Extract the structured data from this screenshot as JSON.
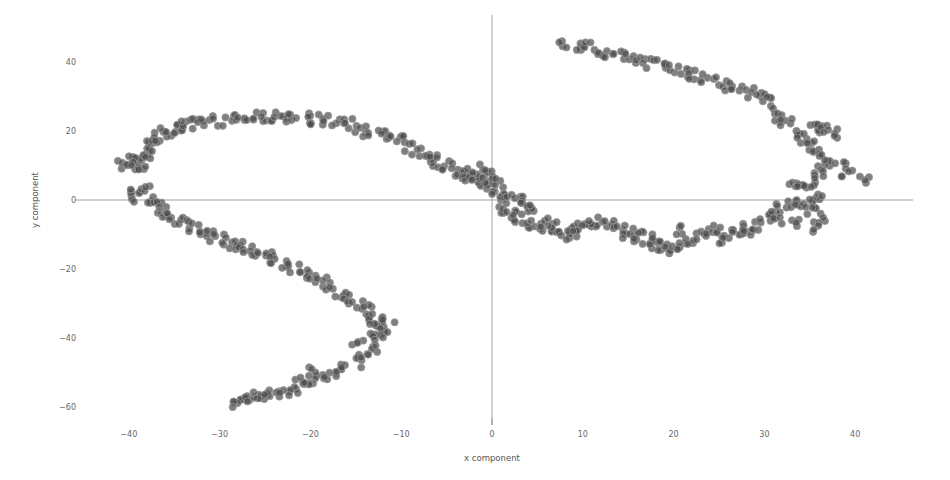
{
  "chart_data": {
    "type": "scatter",
    "title": "",
    "xlabel": "x component",
    "ylabel": "y component",
    "xlim": [
      -45,
      46
    ],
    "ylim": [
      -64,
      47
    ],
    "x_ticks": [
      -40,
      -30,
      -20,
      -10,
      0,
      10,
      20,
      30,
      40
    ],
    "y_ticks": [
      -60,
      -40,
      -20,
      0,
      20,
      40
    ],
    "x_tick_labels": [
      "−40",
      "−30",
      "−20",
      "−10",
      "0",
      "10",
      "20",
      "30",
      "40"
    ],
    "y_tick_labels": [
      "−60",
      "−40",
      "−20",
      "0",
      "20",
      "40"
    ],
    "grid": false,
    "zero_lines": true,
    "legend": null,
    "marker_color": "#4d4d4d",
    "series": [
      {
        "name": "points",
        "x": [
          -40.5,
          -39.8,
          -39.2,
          -38.5,
          -38.8,
          -39.6,
          -38.2,
          -37.6,
          -38.0,
          -37.2,
          -36.6,
          -36.0,
          -35.2,
          -34.4,
          -33.5,
          -32.5,
          -31.4,
          -30.2,
          -29.0,
          -27.8,
          -26.6,
          -25.4,
          -24.2,
          -23.0,
          -21.8,
          -20.6,
          -19.4,
          -18.2,
          -17.0,
          -15.8,
          -14.6,
          -13.5,
          -12.4,
          -11.4,
          -10.4,
          -9.4,
          -8.4,
          -7.4,
          -6.6,
          -5.8,
          -5.0,
          -4.2,
          -3.4,
          -2.6,
          -1.8,
          -1.0,
          -0.2,
          0.6,
          1.4,
          2.2,
          3.0,
          3.8,
          4.6,
          -2.0,
          -1.2,
          -0.4,
          0.4,
          -2.5,
          -40.2,
          -39.0,
          -38.2,
          -37.6,
          -37.0,
          -36.4,
          -35.8,
          -35.2,
          -34.4,
          -33.6,
          -32.8,
          -31.8,
          -30.8,
          -29.8,
          -28.8,
          -27.8,
          -26.8,
          -25.8,
          -24.8,
          -23.8,
          -22.8,
          -21.8,
          -20.8,
          -19.8,
          -18.8,
          -17.8,
          -16.8,
          -15.8,
          -14.8,
          -13.8,
          -13.0,
          -12.4,
          -12.0,
          -12.6,
          -13.2,
          -14.0,
          -15.0,
          -16.0,
          -17.0,
          -18.0,
          -19.0,
          -20.0,
          -21.0,
          -22.0,
          -23.0,
          -24.0,
          -25.0,
          -26.0,
          -27.0,
          -28.0,
          -27.4,
          -25.6,
          -20.4,
          -14.8,
          -13.4,
          -11.4,
          -12.8,
          8.0,
          9.2,
          10.4,
          11.6,
          12.8,
          14.0,
          15.2,
          16.4,
          17.6,
          18.8,
          20.0,
          21.2,
          22.4,
          23.6,
          24.8,
          26.0,
          27.0,
          28.2,
          29.4,
          30.4,
          31.2,
          31.8,
          32.4,
          33.2,
          34.0,
          34.8,
          35.6,
          36.4,
          37.2,
          36.4,
          35.6,
          34.8,
          35.4,
          36.0,
          36.8,
          37.6,
          38.4,
          39.2,
          41.0,
          33.0,
          34.2,
          35.8,
          35.0,
          1.0,
          2.0,
          3.0,
          4.0,
          5.0,
          6.0,
          7.0,
          8.0,
          9.0,
          10.0,
          11.0,
          12.0,
          13.0,
          14.0,
          15.0,
          16.0,
          17.0,
          18.0,
          19.0,
          20.0,
          21.0,
          22.0,
          23.0,
          24.0,
          25.0,
          26.0,
          27.0,
          28.0,
          29.0,
          30.0,
          31.0,
          32.0,
          33.0,
          34.0,
          35.0,
          36.0,
          6.5,
          8.5,
          10.5,
          15.5,
          18.5,
          20.5,
          25.5,
          27.5,
          31.5,
          33.5,
          35.5
        ],
        "y": [
          10.0,
          12.0,
          10.5,
          12.5,
          9.5,
          11.0,
          13.5,
          15.0,
          16.5,
          17.5,
          18.5,
          19.5,
          20.5,
          21.0,
          21.5,
          22.0,
          22.5,
          23.0,
          23.2,
          23.5,
          23.8,
          24.0,
          24.0,
          24.2,
          24.0,
          23.8,
          23.5,
          23.0,
          22.5,
          22.0,
          21.0,
          20.0,
          19.0,
          18.0,
          17.0,
          15.5,
          14.0,
          13.0,
          12.0,
          11.0,
          10.0,
          8.5,
          7.5,
          6.5,
          5.5,
          4.5,
          3.5,
          2.5,
          1.5,
          0.5,
          -0.5,
          -1.5,
          -2.0,
          8.0,
          9.0,
          7.5,
          5.0,
          6.5,
          2.0,
          1.0,
          3.0,
          0.0,
          -1.0,
          -2.5,
          -3.5,
          -5.0,
          -6.0,
          -7.0,
          -8.5,
          -9.5,
          -10.5,
          -11.5,
          -12.5,
          -13.5,
          -14.5,
          -15.5,
          -16.5,
          -17.5,
          -18.5,
          -19.5,
          -21.0,
          -22.5,
          -24.0,
          -25.5,
          -27.0,
          -28.5,
          -30.0,
          -31.5,
          -33.5,
          -35.5,
          -38.0,
          -40.5,
          -43.0,
          -45.0,
          -47.0,
          -48.5,
          -49.5,
          -50.5,
          -51.5,
          -52.5,
          -53.5,
          -54.5,
          -55.5,
          -56.5,
          -57.0,
          -57.5,
          -58.0,
          -58.5,
          -58.0,
          -56.0,
          -50.0,
          -41.5,
          -39.0,
          -34.5,
          -37.0,
          45.5,
          45.0,
          44.2,
          43.5,
          42.8,
          42.0,
          41.2,
          40.5,
          39.5,
          38.8,
          38.0,
          37.0,
          36.0,
          35.0,
          34.0,
          33.2,
          32.2,
          31.2,
          30.0,
          28.5,
          26.5,
          24.0,
          22.0,
          20.0,
          18.0,
          16.5,
          14.5,
          12.5,
          10.5,
          8.5,
          6.5,
          4.5,
          20.5,
          21.0,
          20.0,
          19.0,
          10.0,
          8.0,
          6.5,
          5.0,
          3.0,
          1.5,
          -1.0,
          -3.0,
          -4.5,
          -5.5,
          -6.5,
          -7.5,
          -8.5,
          -9.0,
          -9.5,
          -9.0,
          -8.0,
          -7.0,
          -6.5,
          -7.5,
          -8.5,
          -9.5,
          -10.5,
          -11.5,
          -12.5,
          -13.5,
          -14.0,
          -13.0,
          -11.5,
          -10.5,
          -9.5,
          -8.5,
          -9.5,
          -10.5,
          -9.0,
          -7.5,
          -5.5,
          -3.5,
          -2.0,
          -1.0,
          -2.0,
          -3.5,
          -5.5,
          -6.0,
          -10.0,
          -6.5,
          -11.0,
          -13.5,
          -9.0,
          -12.0,
          -8.0,
          -6.0,
          -7.0,
          -8.0
        ]
      }
    ]
  }
}
